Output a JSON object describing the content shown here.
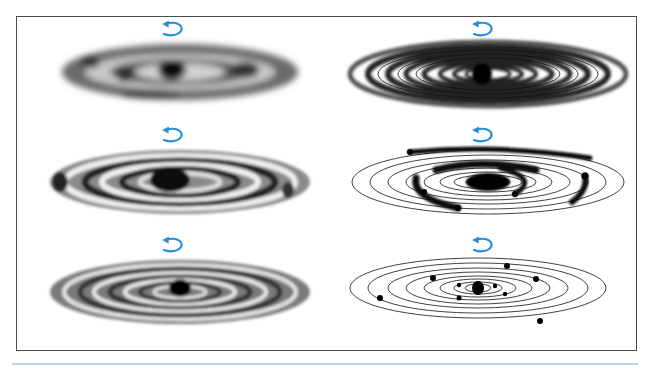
{
  "figure": {
    "layout": "3 rows x 2 columns",
    "colors": {
      "frame": "#4a4a4a",
      "rotation_arrow": "#2a8fd6",
      "matter": "#1a1a1a",
      "bottom_rule": "#b8d6e6"
    },
    "panels": [
      {
        "id": "p1",
        "position": "row1-left",
        "stage": "diffuse rotating cloud with central condensation",
        "icon": "counterclockwise-rotation-arrow"
      },
      {
        "id": "p2",
        "position": "row1-right",
        "stage": "flattened disk with many concentric rings",
        "icon": "counterclockwise-rotation-arrow"
      },
      {
        "id": "p3",
        "position": "row2-left",
        "stage": "clumpy ring structure",
        "icon": "counterclockwise-rotation-arrow"
      },
      {
        "id": "p4",
        "position": "row2-right",
        "stage": "orbits with condensing arcs of material",
        "icon": "counterclockwise-rotation-arrow"
      },
      {
        "id": "p5",
        "position": "row3-left",
        "stage": "banded disk with central mass",
        "icon": "counterclockwise-rotation-arrow"
      },
      {
        "id": "p6",
        "position": "row3-right",
        "stage": "planets on elliptical orbits around central sun",
        "icon": "counterclockwise-rotation-arrow"
      }
    ]
  }
}
